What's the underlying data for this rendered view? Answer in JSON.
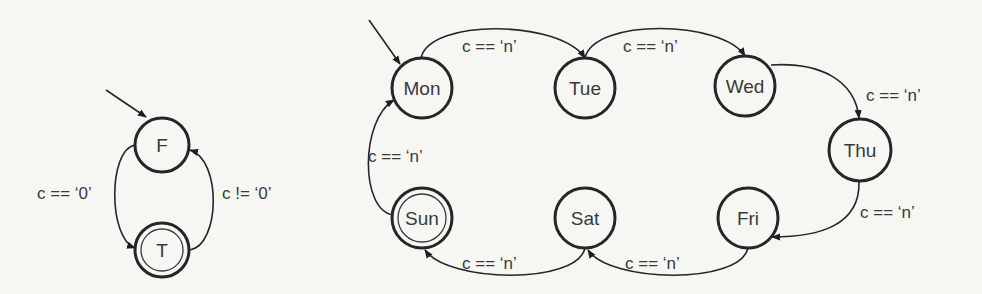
{
  "diagrams": [
    {
      "name": "boolean-fsm",
      "states": [
        {
          "id": "F",
          "label": "F",
          "initial": true,
          "accepting": false
        },
        {
          "id": "T",
          "label": "T",
          "initial": false,
          "accepting": true
        }
      ],
      "transitions": [
        {
          "from": "F",
          "to": "T",
          "label": "c == ‘0’"
        },
        {
          "from": "T",
          "to": "F",
          "label": "c != ‘0’"
        }
      ]
    },
    {
      "name": "weekday-fsm",
      "states": [
        {
          "id": "Mon",
          "label": "Mon",
          "initial": true,
          "accepting": false
        },
        {
          "id": "Tue",
          "label": "Tue",
          "initial": false,
          "accepting": false
        },
        {
          "id": "Wed",
          "label": "Wed",
          "initial": false,
          "accepting": false
        },
        {
          "id": "Thu",
          "label": "Thu",
          "initial": false,
          "accepting": false
        },
        {
          "id": "Fri",
          "label": "Fri",
          "initial": false,
          "accepting": false
        },
        {
          "id": "Sat",
          "label": "Sat",
          "initial": false,
          "accepting": false
        },
        {
          "id": "Sun",
          "label": "Sun",
          "initial": false,
          "accepting": true
        }
      ],
      "transitions": [
        {
          "from": "Mon",
          "to": "Tue",
          "label": "c == ‘n’"
        },
        {
          "from": "Tue",
          "to": "Wed",
          "label": "c == ‘n’"
        },
        {
          "from": "Wed",
          "to": "Thu",
          "label": "c == ‘n’"
        },
        {
          "from": "Thu",
          "to": "Fri",
          "label": "c == ‘n’"
        },
        {
          "from": "Fri",
          "to": "Sat",
          "label": "c == ‘n’"
        },
        {
          "from": "Sat",
          "to": "Sun",
          "label": "c == ‘n’"
        },
        {
          "from": "Sun",
          "to": "Mon",
          "label": "c == ‘n’"
        }
      ]
    }
  ],
  "colors": {
    "background": "#f6f6f3",
    "stroke": "#262626",
    "text": "#3a3a3a"
  }
}
